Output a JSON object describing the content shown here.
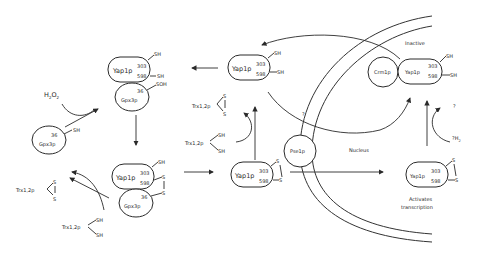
{
  "diagram": {
    "proteins": {
      "yap": "Yap1p",
      "gpx": "Gpx3p",
      "trx": "Trx1,2p",
      "crm": "Crm1p",
      "pse": "Pse1p"
    },
    "residues": {
      "yap_c1": "303",
      "yap_c2": "598",
      "gpx_c": "36"
    },
    "groups": {
      "sh": "SH",
      "soh": "SOH",
      "s": "S"
    },
    "reagents": {
      "h2o2": "H2O2",
      "h2": "?H2"
    },
    "labels": {
      "inactive": "Inactive",
      "nucleus": "Nucleus",
      "activates_1": "Activates",
      "activates_2": "transcription",
      "question": "?"
    },
    "colors": {
      "line": "#2a2a2a",
      "background": "#ffffff"
    }
  }
}
